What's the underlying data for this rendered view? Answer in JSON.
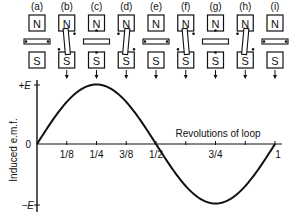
{
  "figure": {
    "stage_labels": [
      "(a)",
      "(b)",
      "(c)",
      "(d)",
      "(e)",
      "(f)",
      "(g)",
      "(h)",
      "(i)"
    ],
    "pole_north": "N",
    "pole_south": "S",
    "loop_angles_deg": [
      0,
      45,
      90,
      135,
      180,
      225,
      270,
      315,
      360
    ]
  },
  "chart_data": {
    "type": "line",
    "title": "",
    "xlabel": "Revolutions of loop",
    "ylabel": "Induced e.m.f.",
    "x_ticks": [
      "1/8",
      "1/4",
      "3/8",
      "1/2",
      "3/4",
      "1"
    ],
    "x_tick_values": [
      0.125,
      0.25,
      0.375,
      0.5,
      0.75,
      1.0
    ],
    "y_ticks": [
      "+E",
      "0",
      "−E"
    ],
    "y_tick_values": [
      1,
      0,
      -1
    ],
    "xlim": [
      0,
      1
    ],
    "ylim": [
      -1,
      1
    ],
    "grid": false,
    "series": [
      {
        "name": "Induced e.m.f.",
        "x": [
          0,
          0.125,
          0.25,
          0.375,
          0.5,
          0.625,
          0.75,
          0.875,
          1.0
        ],
        "values": [
          0,
          0.707,
          1,
          0.707,
          0,
          -0.707,
          -1,
          -0.707,
          0
        ]
      }
    ]
  }
}
